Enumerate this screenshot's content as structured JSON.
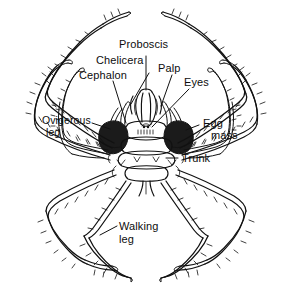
{
  "figure": {
    "style": "black ink line drawing on white",
    "background_color": "#ffffff",
    "ink_color": "#111111",
    "egg_mass_color": "#1b1b1b",
    "width": 293,
    "height": 289
  },
  "labels": {
    "proboscis": "Proboscis",
    "chelicera": "Chelicera",
    "cephalon": "Cephalon",
    "palp": "Palp",
    "eyes": "Eyes",
    "egg_line1": "Egg",
    "egg_line2": "mass",
    "ovigerous_line1": "Ovigerous",
    "ovigerous_line2": "leg",
    "trunk": "Trunk",
    "walking_line1": "Walking",
    "walking_line2": "leg"
  },
  "parts": [
    {
      "name": "proboscis",
      "label": "Proboscis",
      "location": "top center of body"
    },
    {
      "name": "chelicera",
      "label": "Chelicera",
      "location": "upper center, flanking proboscis"
    },
    {
      "name": "cephalon",
      "label": "Cephalon",
      "location": "anterior head segment"
    },
    {
      "name": "palp",
      "label": "Palp",
      "location": "upper center right"
    },
    {
      "name": "eyes",
      "label": "Eyes",
      "location": "center of cephalon, eye tubercle"
    },
    {
      "name": "egg-mass",
      "label": "Egg mass",
      "location": "dark stippled masses both sides"
    },
    {
      "name": "ovigerous-leg",
      "label": "Ovigerous leg",
      "location": "left small leg pair"
    },
    {
      "name": "trunk",
      "label": "Trunk",
      "location": "segmented central body"
    },
    {
      "name": "walking-leg",
      "label": "Walking leg",
      "location": "four long leg pairs"
    }
  ]
}
